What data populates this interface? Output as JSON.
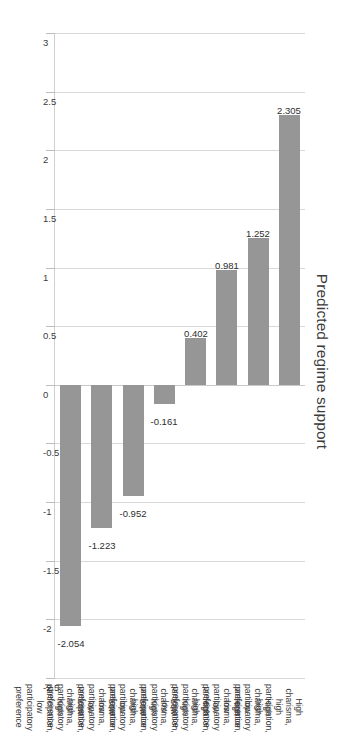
{
  "chart_data": {
    "type": "bar",
    "title": "Predicted regime support",
    "xlabel": "",
    "ylabel": "Predicted regime support",
    "orientation": "vertical-bars-rotated",
    "grid": true,
    "legend": "none",
    "ylim": [
      -2.5,
      3
    ],
    "ticks": [
      "3",
      "2.5",
      "2",
      "1.5",
      "1",
      "0.5",
      "0",
      "-0.5",
      "-1",
      "-1.5",
      "-2",
      "-2.5"
    ],
    "tick_values": [
      3,
      2.5,
      2,
      1.5,
      1,
      0.5,
      0,
      -0.5,
      -1,
      -1.5,
      -2,
      -2.5
    ],
    "categories": [
      "High charisma, high participation, high participatory preference",
      "High charisma, low participation, low participatory preference",
      "High charisma, low participation, high participatory preference",
      "High charisma, high participation, low participatory preference",
      "Low charisma, high participation, high participatory preference",
      "Low charisma, low participation, low participatory preference",
      "Low charisma, low participation, high participatory preference",
      "Low charisma, high participation, low participatory preference"
    ],
    "values": [
      2.305,
      1.252,
      0.981,
      0.402,
      -0.161,
      -0.952,
      -1.223,
      -2.054
    ],
    "value_labels": [
      "2.305",
      "1.252",
      "0.981",
      "0.402",
      "-0.161",
      "-0.952",
      "-1.223",
      "-2.054"
    ],
    "bar_color": "#969696",
    "grid_color": "#d9d9d9",
    "text_color": "#3b3b3b"
  }
}
